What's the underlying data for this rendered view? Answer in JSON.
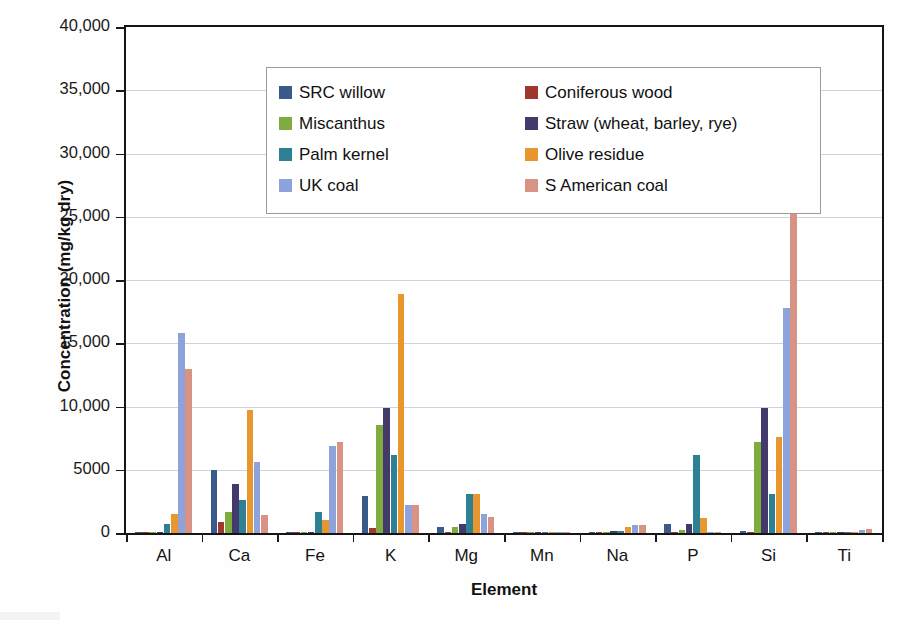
{
  "chart_data": {
    "type": "bar",
    "title": "",
    "xlabel": "Element",
    "ylabel": "Concentration (mg/kg dry)",
    "ylim": [
      0,
      40000
    ],
    "ytick_labels": [
      "0",
      "5000",
      "10,000",
      "15,000",
      "20,000",
      "25,000",
      "30,000",
      "35,000",
      "40,000"
    ],
    "ytick_values": [
      0,
      5000,
      10000,
      15000,
      20000,
      25000,
      30000,
      35000,
      40000
    ],
    "grid": true,
    "legend_position": "upper-left-inside",
    "categories": [
      "Al",
      "Ca",
      "Fe",
      "K",
      "Mg",
      "Mn",
      "Na",
      "P",
      "Si",
      "Ti"
    ],
    "series": [
      {
        "name": "SRC willow",
        "color": "#3A5A8C",
        "values": [
          60,
          5000,
          80,
          2900,
          500,
          30,
          60,
          700,
          120,
          20
        ]
      },
      {
        "name": "Coniferous wood",
        "color": "#A0392B",
        "values": [
          50,
          900,
          60,
          400,
          60,
          40,
          50,
          60,
          60,
          15
        ]
      },
      {
        "name": "Miscanthus",
        "color": "#7FAB3F",
        "values": [
          60,
          1700,
          90,
          8500,
          450,
          30,
          80,
          200,
          7200,
          20
        ]
      },
      {
        "name": "Straw (wheat, barley, rye)",
        "color": "#433A6B",
        "values": [
          70,
          3900,
          110,
          9900,
          700,
          40,
          130,
          700,
          9900,
          25
        ]
      },
      {
        "name": "Palm kernel",
        "color": "#2E8094",
        "values": [
          700,
          2600,
          1700,
          6200,
          3100,
          60,
          120,
          6200,
          3100,
          30
        ]
      },
      {
        "name": "Olive residue",
        "color": "#E8962E",
        "values": [
          1500,
          9700,
          1000,
          18900,
          3100,
          40,
          500,
          1200,
          7600,
          25
        ]
      },
      {
        "name": "UK coal",
        "color": "#8EA3DB",
        "values": [
          15800,
          5600,
          6900,
          2200,
          1500,
          60,
          650,
          100,
          17800,
          250
        ]
      },
      {
        "name": "S American coal",
        "color": "#D99384",
        "values": [
          13000,
          1400,
          7200,
          2200,
          1300,
          50,
          600,
          80,
          33800,
          300
        ]
      }
    ]
  },
  "legend": {
    "items": [
      {
        "label": "SRC willow",
        "swatch": "#3A5A8C"
      },
      {
        "label": "Coniferous wood",
        "swatch": "#A0392B"
      },
      {
        "label": "Miscanthus",
        "swatch": "#7FAB3F"
      },
      {
        "label": "Straw (wheat, barley, rye)",
        "swatch": "#433A6B"
      },
      {
        "label": "Palm kernel",
        "swatch": "#2E8094"
      },
      {
        "label": "Olive residue",
        "swatch": "#E8962E"
      },
      {
        "label": "UK coal",
        "swatch": "#8EA3DB"
      },
      {
        "label": "S American coal",
        "swatch": "#D99384"
      }
    ]
  }
}
